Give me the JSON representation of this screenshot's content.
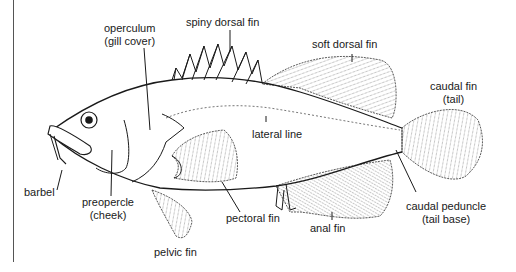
{
  "diagram": {
    "stroke_color": "#1a1a1a",
    "labels": {
      "operculum": {
        "line1": "operculum",
        "line2": "(gill cover)"
      },
      "spiny_dorsal_fin": {
        "line1": "spiny dorsal fin"
      },
      "soft_dorsal_fin": {
        "line1": "soft dorsal fin"
      },
      "caudal_fin": {
        "line1": "caudal fin",
        "line2": "(tail)"
      },
      "lateral_line": {
        "line1": "lateral line"
      },
      "barbel": {
        "line1": "barbel"
      },
      "preopercle": {
        "line1": "preopercle",
        "line2": "(cheek)"
      },
      "pectoral_fin": {
        "line1": "pectoral fin"
      },
      "pelvic_fin": {
        "line1": "pelvic fin"
      },
      "anal_fin": {
        "line1": "anal fin"
      },
      "caudal_peduncle": {
        "line1": "caudal peduncle",
        "line2": "(tail base)"
      }
    }
  }
}
